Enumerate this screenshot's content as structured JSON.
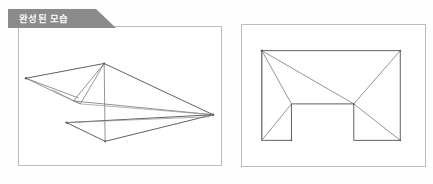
{
  "header": {
    "tab_label": "완성된 모습",
    "tab_bg": "#8b8b8b",
    "tab_text_color": "#ffffff"
  },
  "panels": {
    "left": {
      "name": "perspective-view",
      "caption": "",
      "border_color": "#b9bcc0",
      "background": "#ffffff",
      "line_color": "#75787c"
    },
    "right": {
      "name": "flat-net-view",
      "caption": "",
      "border_color": "#b9bcc0",
      "background": "#ffffff",
      "line_color": "#75787c"
    }
  },
  "figure_left": {
    "description": "3D perspective of folded paper form",
    "vertices": {
      "left_tip": [
        7,
        52
      ],
      "apex": [
        86,
        37
      ],
      "right_tip": [
        196,
        89
      ],
      "bottom_tip": [
        87,
        116
      ],
      "lower_left": [
        48,
        97
      ],
      "mid_fold": [
        63,
        62
      ],
      "inner_left": [
        55,
        75
      ],
      "under_left": [
        33,
        62
      ],
      "under_mid": [
        60,
        68
      ]
    }
  },
  "figure_right": {
    "description": "Flat 2D net with rectangle, two notches and diagonal fold lines",
    "outline": {
      "top_left": [
        20,
        26
      ],
      "top_right": [
        160,
        26
      ],
      "right_mid": [
        160,
        117
      ],
      "notch_right_inner": [
        113,
        117
      ],
      "notch_right_top": [
        113,
        80
      ],
      "notch_left_top": [
        50,
        80
      ],
      "notch_left_inner": [
        50,
        117
      ],
      "left_bottom": [
        20,
        117
      ]
    },
    "fold_lines": [
      "top_left to notch_left_inner",
      "top_left to notch_left_top",
      "top_left to center",
      "center to top_right",
      "center to notch_right_bottom"
    ],
    "center": [
      113,
      80
    ]
  }
}
